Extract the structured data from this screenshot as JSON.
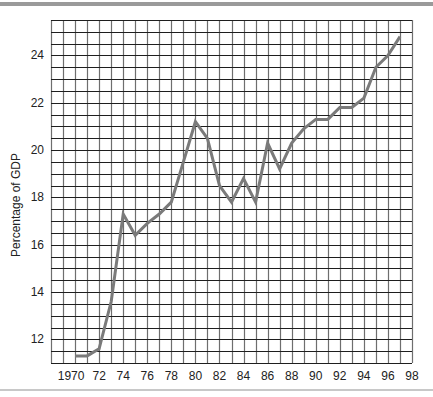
{
  "chart_data": {
    "type": "line",
    "title": "",
    "xlabel": "",
    "ylabel": "Percentage of GDP",
    "x": [
      1970,
      1971,
      1972,
      1973,
      1974,
      1975,
      1976,
      1977,
      1978,
      1979,
      1980,
      1981,
      1982,
      1983,
      1984,
      1985,
      1986,
      1987,
      1988,
      1989,
      1990,
      1991,
      1992,
      1993,
      1994,
      1995,
      1996,
      1997
    ],
    "series": [
      {
        "name": "Percentage of GDP",
        "values": [
          11.3,
          11.3,
          11.6,
          13.6,
          17.3,
          16.4,
          16.9,
          17.3,
          17.8,
          19.5,
          21.2,
          20.5,
          18.5,
          17.8,
          18.8,
          17.8,
          20.3,
          19.2,
          20.3,
          20.9,
          21.3,
          21.3,
          21.8,
          21.8,
          22.2,
          23.5,
          24.0,
          24.8
        ],
        "color": "#7a7a7a"
      }
    ],
    "xticks": [
      "1970",
      "72",
      "74",
      "76",
      "78",
      "80",
      "82",
      "84",
      "86",
      "88",
      "90",
      "92",
      "94",
      "96",
      "98"
    ],
    "xtick_values": [
      1970,
      1972,
      1974,
      1976,
      1978,
      1980,
      1982,
      1984,
      1986,
      1988,
      1990,
      1992,
      1994,
      1996,
      1998
    ],
    "yticks": [
      "12",
      "14",
      "16",
      "18",
      "20",
      "22",
      "24"
    ],
    "ytick_values": [
      12,
      14,
      16,
      18,
      20,
      22,
      24
    ],
    "xlim": [
      1968,
      1998
    ],
    "ylim": [
      11,
      25.5
    ],
    "grid": true,
    "grid_x_step": 1,
    "grid_y_step": 0.5,
    "legend": null
  }
}
